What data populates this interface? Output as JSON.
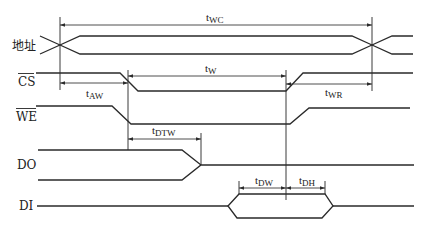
{
  "diagram": {
    "type": "timing-diagram",
    "signals": [
      {
        "id": "address",
        "label": "地址",
        "overline": false
      },
      {
        "id": "cs",
        "label": "CS",
        "overline": true
      },
      {
        "id": "we",
        "label": "WE",
        "overline": true
      },
      {
        "id": "do",
        "label": "DO",
        "overline": false
      },
      {
        "id": "di",
        "label": "DI",
        "overline": false
      }
    ],
    "timings": [
      {
        "id": "twc",
        "base": "t",
        "sub": "WC"
      },
      {
        "id": "taw",
        "base": "t",
        "sub": "AW"
      },
      {
        "id": "tw",
        "base": "t",
        "sub": "W"
      },
      {
        "id": "twr",
        "base": "t",
        "sub": "WR"
      },
      {
        "id": "tdtw",
        "base": "t",
        "sub": "DTW"
      },
      {
        "id": "tdw",
        "base": "t",
        "sub": "DW"
      },
      {
        "id": "tdh",
        "base": "t",
        "sub": "DH"
      }
    ],
    "colors": {
      "line": "#2a2a2a",
      "background": "#ffffff"
    }
  }
}
